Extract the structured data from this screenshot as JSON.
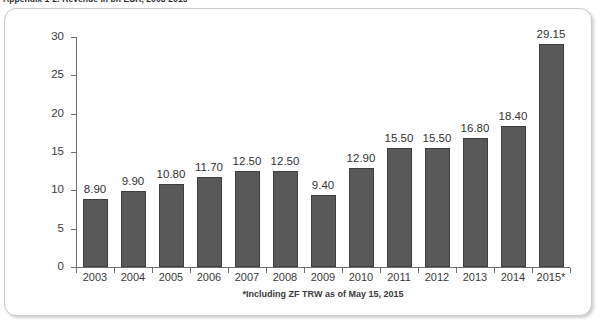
{
  "caption": "Appendix 1-2: Revenue in bn EUR, 2003-2015",
  "footnote": "*Including ZF TRW as of May 15, 2015",
  "colors": {
    "bar_fill": "#595959",
    "bar_stroke": "#3f3f3f",
    "axis": "#6e6e6e",
    "panel_border": "#c9c9c9",
    "text": "#3a3a3a",
    "background": "#ffffff"
  },
  "chart_data": {
    "type": "bar",
    "title": "Appendix 1-2: Revenue in bn EUR, 2003-2015",
    "xlabel": "",
    "ylabel": "",
    "ylim": [
      0,
      30
    ],
    "yticks": [
      0,
      5,
      10,
      15,
      20,
      25,
      30
    ],
    "ytick_labels": [
      "0",
      "5",
      "10",
      "15",
      "20",
      "25",
      "30"
    ],
    "grid": false,
    "legend": false,
    "categories": [
      "2003",
      "2004",
      "2005",
      "2006",
      "2007",
      "2008",
      "2009",
      "2010",
      "2011",
      "2012",
      "2013",
      "2014",
      "2015*"
    ],
    "values": [
      8.9,
      9.9,
      10.8,
      11.7,
      12.5,
      12.5,
      9.4,
      12.9,
      15.5,
      15.5,
      16.8,
      18.4,
      29.15
    ],
    "value_labels": [
      "8.90",
      "9.90",
      "10.80",
      "11.70",
      "12.50",
      "12.50",
      "9.40",
      "12.90",
      "15.50",
      "15.50",
      "16.80",
      "18.40",
      "29.15"
    ],
    "annotations": [
      "*Including ZF TRW as of May 15, 2015"
    ]
  }
}
